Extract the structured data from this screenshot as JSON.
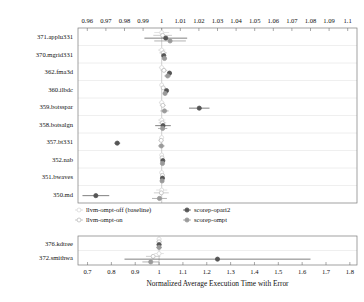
{
  "figure": {
    "width": 364,
    "height": 302,
    "background": "#ffffff"
  },
  "chart_data": {
    "type": "scatter",
    "title": "",
    "subtitle": "",
    "xlabel": "Normalized Average Execution Time with Error",
    "ylabel": "",
    "orientation": "horizontal",
    "panels": [
      {
        "name": "upper-panel",
        "axis_position": "top",
        "xlim": [
          0.955,
          1.105
        ],
        "xticks": [
          0.96,
          0.97,
          0.98,
          0.99,
          1,
          1.01,
          1.02,
          1.03,
          1.04,
          1.05,
          1.06,
          1.07,
          1.08,
          1.09,
          1.1
        ],
        "xticklabels": [
          "0.96",
          "0.97",
          "0.98",
          "0.99",
          "1",
          "1.01",
          "1.02",
          "1.03",
          "1.04",
          "1.05",
          "1.06",
          "1.07",
          "1.08",
          "1.09",
          "1.1"
        ],
        "categories": [
          "371.applu331",
          "370.mgrid331",
          "362.fma3d",
          "360.ilbdc",
          "359.botsspar",
          "358.botsalgn",
          "357.bt331",
          "352.nab",
          "351.bwaves",
          "350.md"
        ],
        "reference_line": 1,
        "grid": true,
        "series": [
          {
            "name": "llvm-ompt-off (baseline)",
            "color": "#d9d9d9",
            "marker": "circle-open",
            "values": [
              1.0,
              1.0,
              1.0,
              1.0,
              1.0,
              1.0,
              1.0,
              1.0,
              1.0,
              1.0
            ],
            "errors": [
              0.004,
              0.002,
              0.0015,
              0.001,
              0.0015,
              0.002,
              0.0012,
              0.0008,
              0.001,
              0.003
            ]
          },
          {
            "name": "llvm-ompt-on",
            "color": "#bdbdbd",
            "marker": "circle-open",
            "values": [
              1.0005,
              1.0008,
              1.0012,
              1.0008,
              1.0006,
              1.0004,
              0.9997,
              1.0002,
              1.0004,
              0.9998
            ],
            "errors": [
              0.005,
              0.002,
              0.0018,
              0.0012,
              0.0016,
              0.002,
              0.0014,
              0.0008,
              0.0012,
              0.004
            ]
          },
          {
            "name": "scorep-opari2",
            "color": "#555555",
            "marker": "circle-filled",
            "values": [
              1.0022,
              1.0011,
              1.0042,
              1.0026,
              1.0202,
              1.0007,
              0.9761,
              1.0006,
              1.0004,
              0.9646
            ],
            "errors": [
              0.0115,
              0.0009,
              0.0012,
              0.0009,
              0.0055,
              0.0042,
              0.0016,
              0.0007,
              0.0009,
              0.0072
            ]
          },
          {
            "name": "scorep-ompt",
            "color": "#9a9a9a",
            "marker": "circle-filled",
            "values": [
              1.0045,
              1.0015,
              1.0032,
              1.0018,
              1.0015,
              1.0005,
              0.9998,
              1.0004,
              1.0002,
              0.9988
            ],
            "errors": [
              0.0085,
              0.0012,
              0.0018,
              0.001,
              0.0022,
              0.0025,
              0.0018,
              0.0008,
              0.001,
              0.004
            ]
          }
        ]
      },
      {
        "name": "lower-panel",
        "axis_position": "bottom",
        "xlim": [
          0.66,
          1.83
        ],
        "xticks": [
          0.7,
          0.8,
          0.9,
          1,
          1.1,
          1.2,
          1.3,
          1.4,
          1.5,
          1.6,
          1.7,
          1.8
        ],
        "xticklabels": [
          "0.7",
          "0.8",
          "0.9",
          "1",
          "1.1",
          "1.2",
          "1.3",
          "1.4",
          "1.5",
          "1.6",
          "1.7",
          "1.8"
        ],
        "categories": [
          "376.kdtree",
          "372.smithwa"
        ],
        "reference_line": 1,
        "grid": true,
        "series": [
          {
            "name": "llvm-ompt-off (baseline)",
            "color": "#d9d9d9",
            "marker": "circle-open",
            "values": [
              1.0,
              1.0
            ],
            "errors": [
              0.01,
              0.02
            ]
          },
          {
            "name": "llvm-ompt-on",
            "color": "#bdbdbd",
            "marker": "circle-open",
            "values": [
              1.0,
              0.975
            ],
            "errors": [
              0.012,
              0.03
            ]
          },
          {
            "name": "scorep-opari2",
            "color": "#555555",
            "marker": "circle-filled",
            "values": [
              1.0,
              1.245
            ],
            "errors": [
              0.01,
              0.39
            ]
          },
          {
            "name": "scorep-ompt",
            "color": "#9a9a9a",
            "marker": "circle-filled",
            "values": [
              1.0,
              0.965
            ],
            "errors": [
              0.012,
              0.035
            ]
          }
        ]
      }
    ],
    "legend": {
      "position": "middle",
      "entries": [
        {
          "label": "llvm-ompt-off (baseline)",
          "color": "#d9d9d9",
          "marker": "circle-open"
        },
        {
          "label": "llvm-ompt-on",
          "color": "#bdbdbd",
          "marker": "circle-open"
        },
        {
          "label": "scorep-opari2",
          "color": "#555555",
          "marker": "circle-filled"
        },
        {
          "label": "scorep-ompt",
          "color": "#9a9a9a",
          "marker": "circle-filled"
        }
      ]
    }
  }
}
